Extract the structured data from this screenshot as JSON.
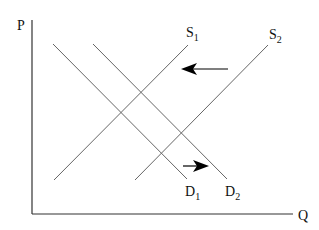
{
  "diagram": {
    "type": "supply-demand",
    "axes": {
      "y_label": "P",
      "x_label": "Q"
    },
    "curves": [
      {
        "name": "D",
        "sub": "1",
        "kind": "demand",
        "x1": 53,
        "y1": 44,
        "x2": 187,
        "y2": 179
      },
      {
        "name": "D",
        "sub": "2",
        "kind": "demand",
        "x1": 93,
        "y1": 44,
        "x2": 227,
        "y2": 179
      },
      {
        "name": "S",
        "sub": "1",
        "kind": "supply",
        "x1": 54,
        "y1": 180,
        "x2": 188,
        "y2": 45
      },
      {
        "name": "S",
        "sub": "2",
        "kind": "supply",
        "x1": 135,
        "y1": 180,
        "x2": 268,
        "y2": 45
      }
    ],
    "shift_arrows": [
      {
        "direction": "left",
        "meaning": "supply shift from S2 to S1"
      },
      {
        "direction": "right",
        "meaning": "demand shift from D1 to D2"
      }
    ],
    "colors": {
      "axis": "#222222",
      "curve": "#555555",
      "arrow": "#000000"
    }
  }
}
